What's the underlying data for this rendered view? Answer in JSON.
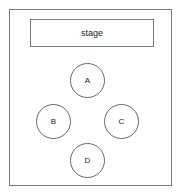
{
  "diagram": {
    "stage": {
      "label": "stage"
    },
    "seats": [
      {
        "label": "A",
        "x": 70,
        "y": 63
      },
      {
        "label": "B",
        "x": 36,
        "y": 104
      },
      {
        "label": "C",
        "x": 104,
        "y": 104
      },
      {
        "label": "D",
        "x": 70,
        "y": 143
      }
    ],
    "colors": {
      "stroke": "#7a7a7a",
      "text": "#222222",
      "background": "#ffffff"
    }
  }
}
